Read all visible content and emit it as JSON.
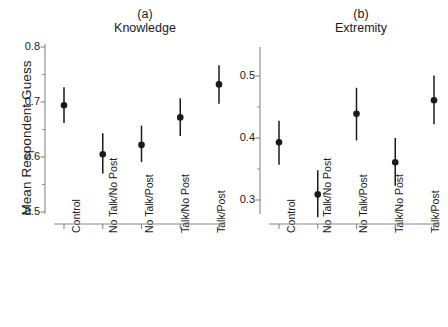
{
  "figure": {
    "ylabel": "Mean Respondent Guess",
    "width": 448,
    "height": 327,
    "background": "#ffffff",
    "ink_color": "#1a1a1a",
    "axis_color": "#888888"
  },
  "chart_data": [
    {
      "type": "scatter",
      "panel": "a",
      "panel_tag": "(a)",
      "title": "Knowledge",
      "xlabel": "",
      "ylabel": "Mean Respondent Guess",
      "ylim": [
        0.5,
        0.8
      ],
      "yticks": [
        0.5,
        0.6,
        0.7,
        0.8
      ],
      "ytick_labels": [
        "0.5",
        "0.6",
        "0.7",
        "0.8"
      ],
      "grid": false,
      "legend": "none",
      "errorbars": true,
      "categories": [
        "Control",
        "No Talk/No Post",
        "No Talk/Post",
        "Talk/No Post",
        "Talk/Post"
      ],
      "values": [
        0.694,
        0.605,
        0.622,
        0.672,
        0.732
      ],
      "err_low": [
        0.662,
        0.57,
        0.591,
        0.638,
        0.697
      ],
      "err_high": [
        0.727,
        0.643,
        0.657,
        0.707,
        0.767
      ]
    },
    {
      "type": "scatter",
      "panel": "b",
      "panel_tag": "(b)",
      "title": "Extremity",
      "xlabel": "",
      "ylabel": "",
      "ylim": [
        0.27,
        0.54
      ],
      "yticks": [
        0.3,
        0.4,
        0.5
      ],
      "ytick_labels": [
        "0.3",
        "0.4",
        "0.5"
      ],
      "grid": false,
      "legend": "none",
      "errorbars": true,
      "categories": [
        "Control",
        "No Talk/No Post",
        "No Talk/Post",
        "Talk/No Post",
        "Talk/Post"
      ],
      "values": [
        0.393,
        0.309,
        0.439,
        0.361,
        0.461
      ],
      "err_low": [
        0.357,
        0.272,
        0.396,
        0.323,
        0.422
      ],
      "err_high": [
        0.428,
        0.348,
        0.481,
        0.4,
        0.501
      ]
    }
  ]
}
